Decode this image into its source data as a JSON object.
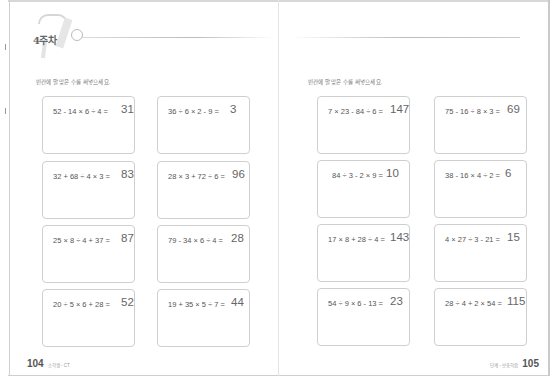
{
  "left_page": {
    "week_label": "4주차",
    "instruction": "빈칸에 알맞은 수를 써넣으세요.",
    "problems": [
      {
        "expression": "52 - 14 × 6 ÷ 4 =",
        "answer": "31"
      },
      {
        "expression": "36 ÷ 6 × 2 - 9 =",
        "answer": "3"
      },
      {
        "expression": "32 + 68 ÷ 4 × 3 =",
        "answer": "83"
      },
      {
        "expression": "28 × 3 + 72 ÷ 6 =",
        "answer": "96"
      },
      {
        "expression": "25 × 8 ÷ 4 + 37 =",
        "answer": "87"
      },
      {
        "expression": "79 - 34 × 6 ÷ 4 =",
        "answer": "28"
      },
      {
        "expression": "20 ÷ 5 × 6 + 28 =",
        "answer": "52"
      },
      {
        "expression": "19 + 35 × 5 ÷ 7 =",
        "answer": "44"
      }
    ],
    "page_number": "104",
    "footer_text": "소학생 - CT"
  },
  "right_page": {
    "instruction": "빈칸에 알맞은 수를 써넣으세요.",
    "problems": [
      {
        "expression": "7 × 23 - 84 ÷ 6 =",
        "answer": "147"
      },
      {
        "expression": "75 - 16 ÷ 8 × 3 =",
        "answer": "69"
      },
      {
        "expression": "84 ÷ 3 - 2 × 9 =",
        "answer": "10"
      },
      {
        "expression": "38 - 16 × 4 ÷ 2 =",
        "answer": "6"
      },
      {
        "expression": "17 × 8 + 28 ÷ 4 =",
        "answer": "143"
      },
      {
        "expression": "4 × 27 ÷ 3 - 21 =",
        "answer": "15"
      },
      {
        "expression": "54 ÷ 9 × 6 - 13 =",
        "answer": "23"
      },
      {
        "expression": "28 ÷ 4 + 2 × 54 =",
        "answer": "115"
      }
    ],
    "page_number": "105",
    "footer_text": "단계 - 보충학습"
  }
}
